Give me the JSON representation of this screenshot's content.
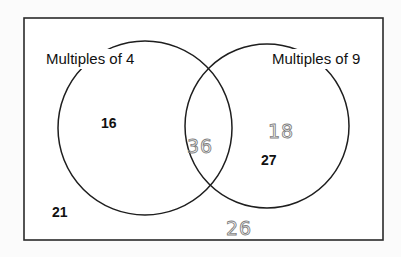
{
  "diagram": {
    "type": "venn",
    "universe_box": {
      "x": 24,
      "y": 18,
      "width": 359,
      "height": 222
    },
    "sets": [
      {
        "id": "A",
        "label": "Multiples of 4",
        "circle": {
          "cx": 145,
          "cy": 128,
          "r": 87
        },
        "label_pos": {
          "x": 46,
          "y": 64
        }
      },
      {
        "id": "B",
        "label": "Multiples of 9",
        "circle": {
          "cx": 267,
          "cy": 126,
          "r": 82
        },
        "label_pos": {
          "x": 272,
          "y": 64
        }
      }
    ],
    "regions": {
      "only_A": {
        "printed": [
          "16"
        ],
        "handwritten": []
      },
      "A_and_B": {
        "printed": [],
        "handwritten": [
          "36"
        ]
      },
      "only_B": {
        "printed": [
          "27"
        ],
        "handwritten": [
          "18"
        ]
      },
      "outside": {
        "printed": [
          "21"
        ],
        "handwritten": [
          "26"
        ]
      }
    },
    "numbers": [
      {
        "value": "16",
        "style": "printed",
        "region": "only_A",
        "x": 101,
        "y": 128
      },
      {
        "value": "36",
        "style": "handwritten",
        "region": "A_and_B",
        "x": 187,
        "y": 153
      },
      {
        "value": "18",
        "style": "handwritten",
        "region": "only_B",
        "x": 268,
        "y": 138
      },
      {
        "value": "27",
        "style": "printed",
        "region": "only_B",
        "x": 261,
        "y": 165
      },
      {
        "value": "21",
        "style": "printed",
        "region": "outside",
        "x": 52,
        "y": 217
      },
      {
        "value": "26",
        "style": "handwritten",
        "region": "outside",
        "x": 226,
        "y": 235
      }
    ],
    "colors": {
      "printed_ink": "#111111",
      "handwritten_ink": "#7f7f7f",
      "background": "#fbfbfb",
      "line": "#2a2a2a"
    }
  }
}
